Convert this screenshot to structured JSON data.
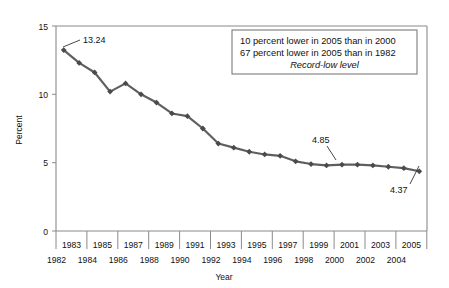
{
  "chart_data": {
    "type": "line",
    "title": "",
    "xlabel": "Year",
    "ylabel": "Percent",
    "ylim": [
      0,
      15
    ],
    "yticks": [
      0,
      5,
      10,
      15
    ],
    "ytick_labels": [
      "0",
      "5",
      "10",
      "15"
    ],
    "grid": false,
    "legend": "none",
    "x": [
      1982,
      1983,
      1984,
      1985,
      1986,
      1987,
      1988,
      1989,
      1990,
      1991,
      1992,
      1993,
      1994,
      1995,
      1996,
      1997,
      1998,
      1999,
      2000,
      2001,
      2002,
      2003,
      2004,
      2005
    ],
    "categories": [
      "1982",
      "1983",
      "1984",
      "1985",
      "1986",
      "1987",
      "1988",
      "1989",
      "1990",
      "1991",
      "1992",
      "1993",
      "1994",
      "1995",
      "1996",
      "1997",
      "1998",
      "1999",
      "2000",
      "2001",
      "2002",
      "2003",
      "2004",
      "2005"
    ],
    "values": [
      13.24,
      12.3,
      11.6,
      10.2,
      10.8,
      10.0,
      9.4,
      8.6,
      8.4,
      7.5,
      6.4,
      6.1,
      5.8,
      5.6,
      5.5,
      5.1,
      4.9,
      4.8,
      4.85,
      4.85,
      4.8,
      4.7,
      4.6,
      4.37
    ],
    "series": [
      {
        "name": "Percent",
        "values": [
          13.24,
          12.3,
          11.6,
          10.2,
          10.8,
          10.0,
          9.4,
          8.6,
          8.4,
          7.5,
          6.4,
          6.1,
          5.8,
          5.6,
          5.5,
          5.1,
          4.9,
          4.8,
          4.85,
          4.85,
          4.8,
          4.7,
          4.6,
          4.37
        ],
        "color": "#5f5f5f",
        "marker": "diamond"
      }
    ],
    "xtick_labels_upper": [
      "1983",
      "1985",
      "1987",
      "1989",
      "1991",
      "1993",
      "1995",
      "1997",
      "1999",
      "2001",
      "2003",
      "2005"
    ],
    "xtick_labels_lower": [
      "1982",
      "1984",
      "1986",
      "1988",
      "1990",
      "1992",
      "1994",
      "1996",
      "1998",
      "2000",
      "2002",
      "2004"
    ],
    "annotations": [
      {
        "label": "13.24",
        "year": 1982,
        "value": 13.24
      },
      {
        "label": "4.85",
        "year": 2000,
        "value": 4.85
      },
      {
        "label": "4.37",
        "year": 2005,
        "value": 4.37
      }
    ],
    "textbox": {
      "line1": "10 percent lower in 2005 than in 2000",
      "line2": "67 percent lower in 2005 than in 1982",
      "line3": "Record-low level"
    }
  },
  "axes": {
    "ylabel": "Percent",
    "xlabel": "Year",
    "ytick_0": "0",
    "ytick_5": "5",
    "ytick_10": "10",
    "ytick_15": "15"
  },
  "xlabels": {
    "upper": {
      "t0": "1983",
      "t1": "1985",
      "t2": "1987",
      "t3": "1989",
      "t4": "1991",
      "t5": "1993",
      "t6": "1995",
      "t7": "1997",
      "t8": "1999",
      "t9": "2001",
      "t10": "2003",
      "t11": "2005"
    },
    "lower": {
      "b0": "1982",
      "b1": "1984",
      "b2": "1986",
      "b3": "1988",
      "b4": "1990",
      "b5": "1992",
      "b6": "1994",
      "b7": "1996",
      "b8": "1998",
      "b9": "2000",
      "b10": "2002",
      "b11": "2004"
    }
  },
  "callouts": {
    "first": "13.24",
    "mid": "4.85",
    "last": "4.37"
  },
  "note_box": {
    "line1": "10 percent lower in 2005 than in 2000",
    "line2": "67 percent lower in 2005 than in 1982",
    "line3": "Record-low level"
  },
  "colors": {
    "line": "#5f5f5f",
    "marker": "#4a4a4a",
    "axis": "#8a8a8a",
    "text": "#111111",
    "background": "#ffffff"
  }
}
